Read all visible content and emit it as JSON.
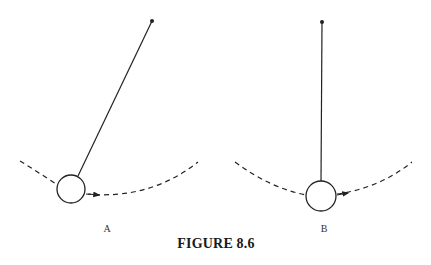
{
  "figure": {
    "caption": "FIGURE 8.6",
    "panels": [
      {
        "label": "A",
        "description": "Pendulum displaced to the left of vertical, bob on dashed arc with arrow pointing right",
        "pivot": [
          152,
          21
        ],
        "bob_center": [
          71,
          189
        ],
        "bob_radius": 14
      },
      {
        "label": "B",
        "description": "Pendulum hanging vertically at the bottom of its swing, bob on dashed arc with arrow pointing right",
        "pivot": [
          322,
          22
        ],
        "bob_center": [
          321,
          196
        ],
        "bob_radius": 15
      }
    ],
    "colors": {
      "ink": "#222222",
      "background": "#ffffff"
    }
  }
}
